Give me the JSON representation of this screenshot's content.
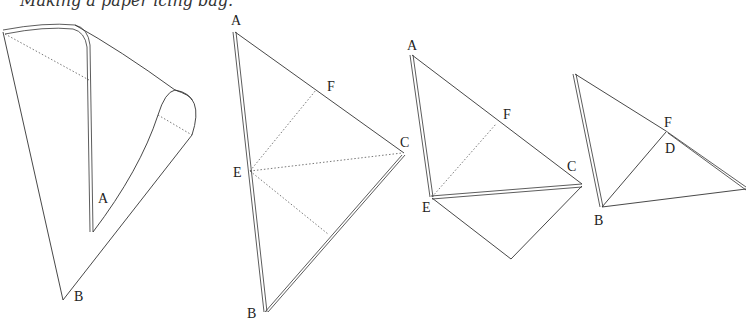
{
  "caption": "Making a paper icing bag.",
  "figures": [
    {
      "id": "figure-1-cone",
      "description": "Rolled paper cone",
      "labels": [
        "A",
        "B"
      ]
    },
    {
      "id": "figure-2-triangle",
      "description": "Paper triangle with fold lines",
      "labels": [
        "A",
        "F",
        "C",
        "E",
        "B"
      ]
    },
    {
      "id": "figure-3-folded",
      "description": "Triangle folded along E-C",
      "labels": [
        "A",
        "F",
        "C",
        "E"
      ]
    },
    {
      "id": "figure-4-folded",
      "description": "Triangle folded so B meets D",
      "labels": [
        "F",
        "D",
        "B"
      ]
    }
  ],
  "colors": {
    "line": "#333333",
    "background": "#ffffff"
  }
}
